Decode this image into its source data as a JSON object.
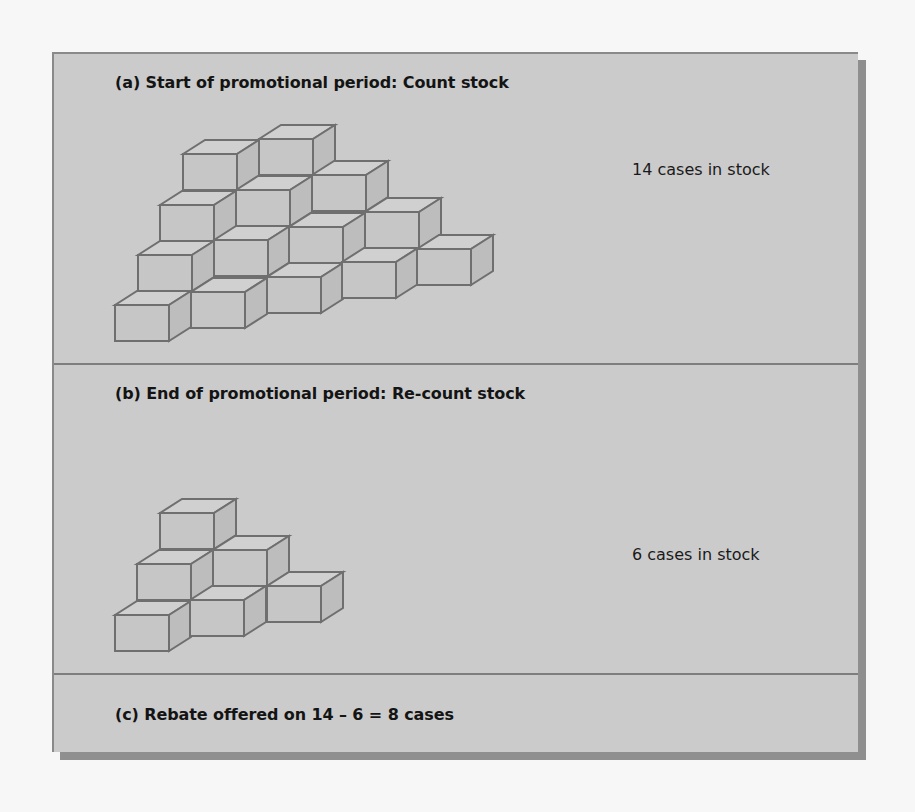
{
  "figure": {
    "panels": [
      {
        "id": "a",
        "heading": "(a) Start of promotional period: Count stock",
        "count_label": "14 cases in stock",
        "case_count": 14
      },
      {
        "id": "b",
        "heading": "(b) End of promotional period: Re-count stock",
        "count_label": "6 cases in stock",
        "case_count": 6
      },
      {
        "id": "c",
        "heading": "(c) Rebate offered on 14 – 6 = 8 cases",
        "rebate_cases": 8
      }
    ],
    "colors": {
      "background": "#cbcbcb",
      "cube_front": "#c6c6c6",
      "cube_top": "#d0d0d0",
      "cube_side": "#bdbdbd",
      "cube_outline": "#6f6f6f",
      "shadow": "#8f8f8f"
    },
    "cube_geometry": {
      "front_width": 54,
      "front_height": 36,
      "depth_dx": 22,
      "depth_dy": -14
    },
    "cube_stacks": {
      "a": [
        [
          181,
          152
        ],
        [
          257,
          137
        ],
        [
          158,
          203
        ],
        [
          234,
          188
        ],
        [
          310,
          173
        ],
        [
          136,
          253
        ],
        [
          212,
          238
        ],
        [
          287,
          225
        ],
        [
          363,
          210
        ],
        [
          113,
          303
        ],
        [
          189,
          290
        ],
        [
          265,
          275
        ],
        [
          340,
          260
        ],
        [
          415,
          247
        ]
      ],
      "b": [
        [
          158,
          511
        ],
        [
          135,
          562
        ],
        [
          211,
          548
        ],
        [
          113,
          613
        ],
        [
          188,
          598
        ],
        [
          265,
          584
        ]
      ]
    }
  }
}
